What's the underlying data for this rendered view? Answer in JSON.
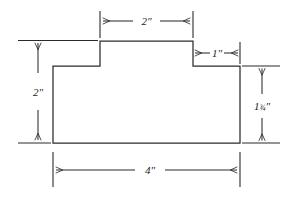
{
  "drawing": {
    "title": "Stepped block cross-section dimensioned drawing",
    "unit_symbol": "\"",
    "line_color": "#2b2b2b",
    "background_color": "#ffffff",
    "text_color": "#1d1d1d",
    "shape": {
      "name": "stepped-block-outline",
      "description": "Rectangular block with a raised center tab (plateau) forming two shoulders",
      "points": "53,143 53,66 100,66 100,41 193,41 193,66 240,66 240,143"
    },
    "dimensions": [
      {
        "id": "top-plateau-width",
        "label": "2\"",
        "value": 2,
        "unit": "in",
        "orientation": "horizontal",
        "position": "top",
        "measures": "width of raised center tab"
      },
      {
        "id": "right-shoulder-width",
        "label": "1\"",
        "value": 1,
        "unit": "in",
        "orientation": "horizontal",
        "position": "upper-right",
        "measures": "width of right shoulder"
      },
      {
        "id": "overall-height-left",
        "label": "2\"",
        "value": 2,
        "unit": "in",
        "orientation": "vertical",
        "position": "left",
        "measures": "overall height including tab"
      },
      {
        "id": "body-height-right",
        "label": "1¾\"",
        "label_whole": "1",
        "label_fraction": "¾",
        "label_suffix": "\"",
        "value": 1.75,
        "unit": "in",
        "orientation": "vertical",
        "position": "right",
        "measures": "height of main body below tab"
      },
      {
        "id": "overall-width-bottom",
        "label": "4\"",
        "value": 4,
        "unit": "in",
        "orientation": "horizontal",
        "position": "bottom",
        "measures": "overall width of block"
      }
    ]
  }
}
